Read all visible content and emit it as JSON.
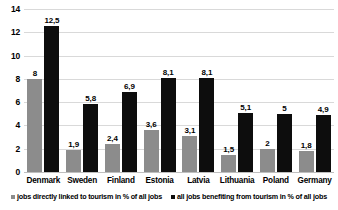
{
  "chart_data": {
    "type": "bar",
    "title": "",
    "xlabel": "",
    "ylabel": "",
    "ylim": [
      0,
      14
    ],
    "yticks": [
      "0",
      "2",
      "4",
      "6",
      "8",
      "10",
      "12",
      "14"
    ],
    "grid": true,
    "legend_position": "bottom",
    "categories": [
      "Denmark",
      "Sweden",
      "Finland",
      "Estonia",
      "Latvia",
      "Lithuania",
      "Poland",
      "Germany"
    ],
    "series": [
      {
        "name": "jobs directly linked to tourism in % of all jobs",
        "color": "#8c8c8c",
        "values": [
          8,
          1.9,
          2.4,
          3.6,
          3.1,
          1.5,
          2,
          1.8
        ],
        "labels": [
          "8",
          "1,9",
          "2,4",
          "3,6",
          "3,1",
          "1,5",
          "2",
          "1,8"
        ]
      },
      {
        "name": "all jobs benefiting from tourism in % of all jobs",
        "color": "#0d0d0d",
        "values": [
          12.5,
          5.8,
          6.9,
          8.1,
          8.1,
          5.1,
          5,
          4.9
        ],
        "labels": [
          "12,5",
          "5,8",
          "6,9",
          "8,1",
          "8,1",
          "5,1",
          "5",
          "4,9"
        ]
      }
    ]
  }
}
